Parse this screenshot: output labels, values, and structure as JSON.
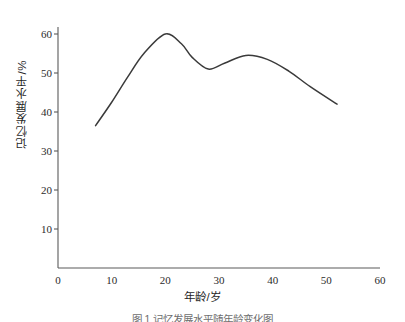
{
  "figure": {
    "caption": "图 1  记忆发展水平随年龄变化图",
    "background_color": "#ffffff",
    "line_color": "#3a3a3a",
    "axis_color": "#5a5a5a"
  },
  "axes": {
    "x_title": "年龄/岁",
    "y_title": "记忆发展水平/%",
    "x_ticks": [
      "0",
      "10",
      "20",
      "30",
      "40",
      "50",
      "60"
    ],
    "y_ticks": [
      "10",
      "20",
      "30",
      "40",
      "50",
      "60"
    ]
  },
  "chart_data": {
    "type": "line",
    "title": "",
    "xlabel": "年龄/岁",
    "ylabel": "记忆发展水平/%",
    "xlim": [
      0,
      60
    ],
    "ylim": [
      0,
      65
    ],
    "xticks": [
      0,
      10,
      20,
      30,
      40,
      50,
      60
    ],
    "yticks": [
      10,
      20,
      30,
      40,
      50,
      60
    ],
    "grid": false,
    "legend": false,
    "series": [
      {
        "name": "记忆发展水平",
        "color": "#3a3a3a",
        "x": [
          7,
          10,
          13,
          16,
          20,
          23,
          25,
          28,
          31,
          35,
          39,
          43,
          47,
          52
        ],
        "y": [
          36.5,
          42.5,
          49.0,
          55.0,
          60.0,
          57.5,
          54.0,
          51.0,
          52.5,
          54.5,
          53.5,
          50.5,
          46.5,
          42.0
        ]
      }
    ],
    "annotations": [
      {
        "label": "起点",
        "x": 7,
        "y": 36.5
      },
      {
        "label": "峰值",
        "x": 20,
        "y": 60.0
      },
      {
        "label": "低谷",
        "x": 28,
        "y": 51.0
      },
      {
        "label": "次峰",
        "x": 35,
        "y": 54.5
      },
      {
        "label": "终点",
        "x": 52,
        "y": 42.0
      }
    ]
  }
}
